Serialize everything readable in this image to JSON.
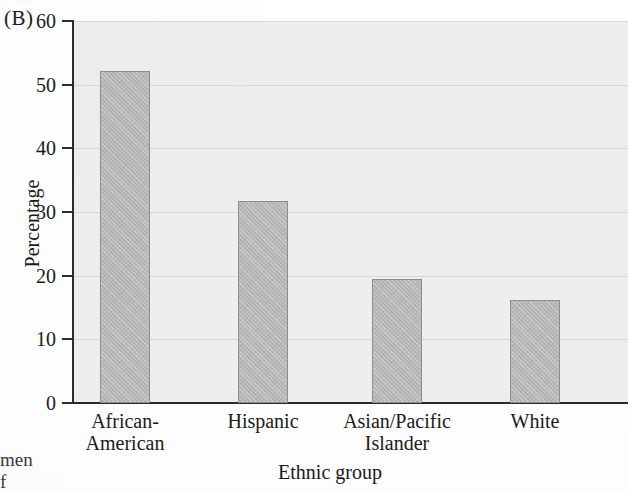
{
  "panel": {
    "label": "(B)"
  },
  "caption_fragment": {
    "text": "men\nf"
  },
  "chart_data": {
    "type": "bar",
    "title": "",
    "subtitle": "",
    "xlabel": "Ethnic group",
    "ylabel": "Percentage",
    "categories": [
      "African-\nAmerican",
      "Hispanic",
      "Asian/Pacific\nIslander",
      "White"
    ],
    "values": [
      52.1,
      31.7,
      19.5,
      16.2
    ],
    "ylim": [
      0,
      60
    ],
    "yticks": [
      0,
      10,
      20,
      30,
      40,
      50,
      60
    ],
    "ytick_labels": [
      "0",
      "10",
      "20",
      "30",
      "40",
      "50",
      "60"
    ],
    "grid": true,
    "grid_axis": "y",
    "legend": false,
    "legend_position": "none",
    "bar_color": "#b6b6b6",
    "bar_edge_color": "#8d8d8d",
    "plot_background": "#eeeeee"
  }
}
